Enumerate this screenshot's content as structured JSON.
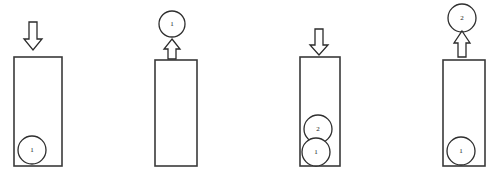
{
  "figure": {
    "panel_count": 4,
    "colors": {
      "background": "#ffffff",
      "outline": "#3a3a3a",
      "ball_outline": "#2e2e2e",
      "arrow_outline": "#2b2b2b",
      "fill": "#ffffff",
      "label_text": "#1a1a1a"
    },
    "panels": [
      {
        "id": "panel-1",
        "name": "push-ball-1",
        "arrow": {
          "direction": "down",
          "name": "down-arrow",
          "x": 33,
          "y_top": 22,
          "y_bottom": 50
        },
        "tube": {
          "x": 14,
          "y": 57,
          "width": 48,
          "height": 109
        },
        "balls": [
          {
            "label": "1",
            "cx": 32,
            "cy": 150,
            "r": 14
          }
        ]
      },
      {
        "id": "panel-2",
        "name": "pop-ball-1",
        "arrow": {
          "direction": "up",
          "name": "up-arrow",
          "x": 172,
          "y_top": 41,
          "y_bottom": 58
        },
        "tube": {
          "x": 155,
          "y": 59,
          "width": 42,
          "height": 107
        },
        "balls": [
          {
            "label": "1",
            "cx": 172,
            "cy": 24,
            "r": 13
          }
        ]
      },
      {
        "id": "panel-3",
        "name": "push-ball-2",
        "arrow": {
          "direction": "down",
          "name": "down-arrow",
          "x": 319,
          "y_top": 29,
          "y_bottom": 55
        },
        "tube": {
          "x": 300,
          "y": 57,
          "width": 40,
          "height": 109
        },
        "balls": [
          {
            "label": "2",
            "cx": 318,
            "cy": 129,
            "r": 14
          },
          {
            "label": "1",
            "cx": 316,
            "cy": 152,
            "r": 14
          }
        ]
      },
      {
        "id": "panel-4",
        "name": "pop-ball-2",
        "arrow": {
          "direction": "up",
          "name": "up-arrow",
          "x": 462,
          "y_top": 33,
          "y_bottom": 56
        },
        "tube": {
          "x": 443,
          "y": 60,
          "width": 42,
          "height": 106
        },
        "balls": [
          {
            "label": "2",
            "cx": 462,
            "cy": 18,
            "r": 14
          },
          {
            "label": "1",
            "cx": 461,
            "cy": 151,
            "r": 14
          }
        ]
      }
    ]
  }
}
